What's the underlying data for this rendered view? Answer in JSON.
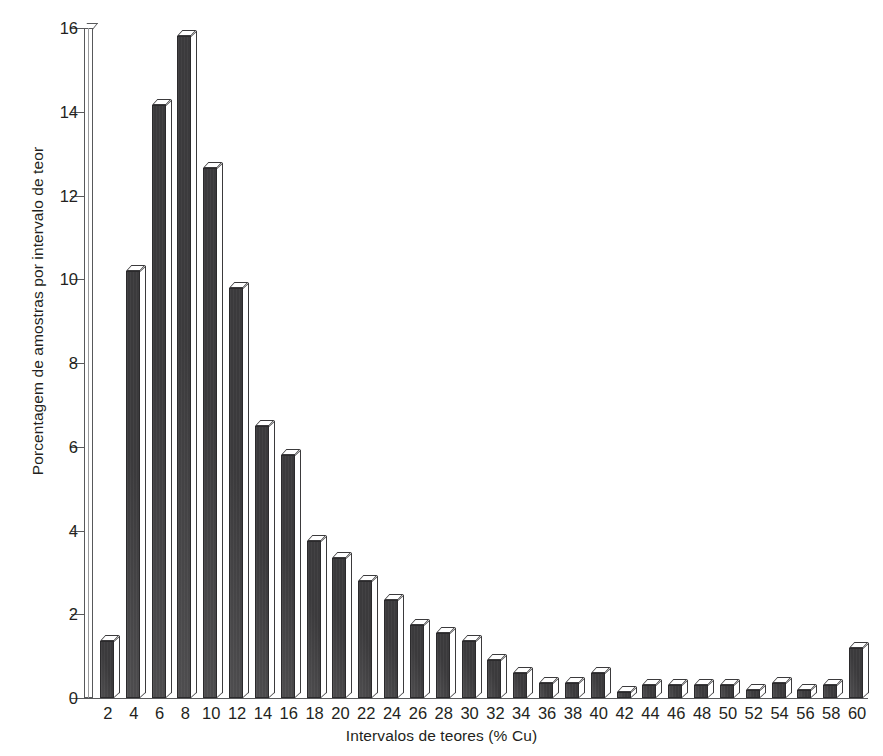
{
  "chart_data": {
    "type": "bar",
    "title": "",
    "subtitle": "",
    "xlabel": "Intervalos de teores (% Cu)",
    "ylabel": "Porcentagem de amostras por intervalo de teor",
    "grid": false,
    "legend": null,
    "xlim": [
      0,
      61
    ],
    "ylim": [
      0,
      16
    ],
    "yticks": [
      0,
      2,
      4,
      6,
      8,
      10,
      12,
      14,
      16
    ],
    "categories": [
      "2",
      "4",
      "6",
      "8",
      "10",
      "12",
      "14",
      "16",
      "18",
      "20",
      "22",
      "24",
      "26",
      "28",
      "30",
      "32",
      "34",
      "36",
      "38",
      "40",
      "42",
      "44",
      "46",
      "48",
      "50",
      "52",
      "54",
      "56",
      "58",
      "60"
    ],
    "values": [
      1.35,
      10.2,
      14.15,
      15.8,
      12.65,
      9.8,
      6.5,
      5.8,
      3.75,
      3.35,
      2.8,
      2.35,
      1.75,
      1.55,
      1.35,
      0.9,
      0.6,
      0.35,
      0.35,
      0.6,
      0.15,
      0.3,
      0.3,
      0.3,
      0.3,
      0.2,
      0.35,
      0.2,
      0.3,
      1.2
    ],
    "series": [
      {
        "name": "Porcentagem de amostras",
        "values": [
          1.35,
          10.2,
          14.15,
          15.8,
          12.65,
          9.8,
          6.5,
          5.8,
          3.75,
          3.35,
          2.8,
          2.35,
          1.75,
          1.55,
          1.35,
          0.9,
          0.6,
          0.35,
          0.35,
          0.6,
          0.15,
          0.3,
          0.3,
          0.3,
          0.3,
          0.2,
          0.35,
          0.2,
          0.3,
          1.2
        ]
      }
    ],
    "bar_style": "3d-extruded",
    "colors": {
      "bar_face": "#3b3a3c",
      "bar_top": "#ffffff",
      "bar_side": "#ffffff",
      "bar_outline": "#2b2a2c",
      "axis": "#58595b",
      "text": "#231f20",
      "background": "#ffffff"
    }
  }
}
